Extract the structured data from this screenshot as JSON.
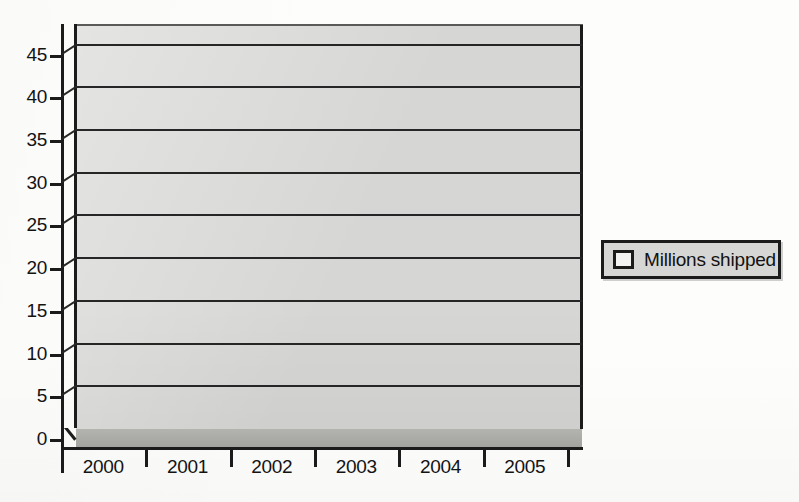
{
  "chart_data": {
    "type": "bar",
    "title": "",
    "xlabel": "",
    "ylabel": "",
    "categories": [
      "2000",
      "2001",
      "2002",
      "2003",
      "2004",
      "2005"
    ],
    "values": [
      3.6,
      7.3,
      13.4,
      20.7,
      29.4,
      41.8
    ],
    "series": [
      {
        "name": "Millions shipped",
        "values": [
          3.6,
          7.3,
          13.4,
          20.7,
          29.4,
          41.8
        ]
      }
    ],
    "ylim": [
      0,
      47
    ],
    "yticks": [
      0,
      5,
      10,
      15,
      20,
      25,
      30,
      35,
      40,
      45
    ],
    "ytick_labels": [
      "0",
      "5",
      "10",
      "15",
      "20",
      "25",
      "30",
      "35",
      "40",
      "45"
    ],
    "grid": true,
    "grid_axis": "y",
    "legend": {
      "position": "right",
      "entries": [
        "Millions shipped"
      ]
    },
    "style": "3d-bar",
    "colors": {
      "bar_front": "#6e6e6c",
      "bar_top": "#cfcfcc",
      "bar_side": "#4e4e4c",
      "plot_background": "#d6d6d4",
      "floor": "#a9a9a6",
      "axis": "#1b1b1b",
      "gridline": "#262626",
      "page_background": "#fdfdfc",
      "legend_background": "#d6d6d4",
      "legend_swatch": "#f3f3f1"
    }
  },
  "legend": {
    "label": "Millions shipped"
  },
  "axes": {
    "y_labels": [
      "45",
      "40",
      "35",
      "30",
      "25",
      "20",
      "15",
      "10",
      "5",
      "0"
    ],
    "x_labels": [
      "2000",
      "2001",
      "2002",
      "2003",
      "2004",
      "2005"
    ]
  }
}
